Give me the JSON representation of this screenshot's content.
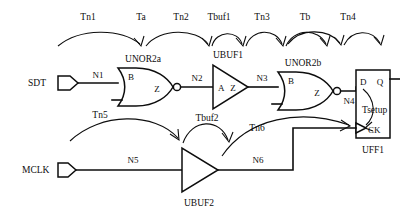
{
  "diagram": {
    "ports": [
      {
        "name": "SDT",
        "label": "SDT",
        "kind": "input-port"
      },
      {
        "name": "MCLK",
        "label": "MCLK",
        "kind": "input-port"
      }
    ],
    "nets": [
      {
        "id": "n1",
        "label": "N1"
      },
      {
        "id": "n2",
        "label": "N2"
      },
      {
        "id": "n3",
        "label": "N3"
      },
      {
        "id": "n4",
        "label": "N4"
      },
      {
        "id": "n5",
        "label": "N5"
      },
      {
        "id": "n6",
        "label": "N6"
      }
    ],
    "instances": [
      {
        "id": "unor2a",
        "label": "UNOR2a",
        "type": "nor2",
        "pins": {
          "in": "B",
          "out": "Z"
        }
      },
      {
        "id": "ubuf1",
        "label": "UBUF1",
        "type": "buffer",
        "pins": {
          "in": "A",
          "out": "Z"
        }
      },
      {
        "id": "unor2b",
        "label": "UNOR2b",
        "type": "nor2",
        "pins": {
          "in": "B",
          "out": "Z"
        }
      },
      {
        "id": "ubuf2",
        "label": "UBUF2",
        "type": "buffer",
        "pins": {
          "in": "",
          "out": ""
        }
      },
      {
        "id": "uff1",
        "label": "UFF1",
        "type": "dff",
        "pins": {
          "d": "D",
          "q": "Q",
          "ck": "CK"
        }
      }
    ],
    "delays": [
      {
        "id": "tn1",
        "label": "Tn1"
      },
      {
        "id": "ta",
        "label": "Ta"
      },
      {
        "id": "tn2",
        "label": "Tn2"
      },
      {
        "id": "tbuf1",
        "label": "Tbuf1"
      },
      {
        "id": "tn3",
        "label": "Tn3"
      },
      {
        "id": "tb",
        "label": "Tb"
      },
      {
        "id": "tn4",
        "label": "Tn4"
      },
      {
        "id": "tn5",
        "label": "Tn5"
      },
      {
        "id": "tbuf2",
        "label": "Tbuf2"
      },
      {
        "id": "tn6",
        "label": "Tn6"
      },
      {
        "id": "tsetup",
        "label": "Tsetup"
      }
    ],
    "colors": {
      "ink": "#0d0d0d",
      "background": "#ffffff"
    }
  }
}
